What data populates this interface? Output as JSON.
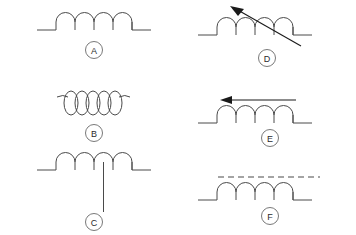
{
  "diagram": {
    "background_color": "#ffffff",
    "line_color": "#4a4a4a",
    "arrow_color": "#1a1a1a",
    "label_color": "#2b2b2b",
    "columns": 2,
    "rows": 3,
    "symbols": [
      {
        "label": "A",
        "name": "fixed-inductor",
        "description": "Fixed inductor: five semicircular humps with straight lead wires on both sides",
        "humps": 5,
        "has_arrow": false,
        "has_core_line": false,
        "has_center_tap": false,
        "coil_style": "arcs",
        "position": {
          "col": 1,
          "row": 1
        }
      },
      {
        "label": "B",
        "name": "air-core-coil",
        "description": "Coil drawn as five full elliptical loops with short angled lead wires",
        "humps": 5,
        "has_arrow": false,
        "has_core_line": false,
        "has_center_tap": false,
        "coil_style": "loops",
        "position": {
          "col": 1,
          "row": 2
        }
      },
      {
        "label": "C",
        "name": "center-tapped-inductor",
        "description": "Inductor with a vertical center tap lead dropping from the middle of the winding",
        "humps": 5,
        "has_arrow": false,
        "has_core_line": false,
        "has_center_tap": true,
        "coil_style": "arcs",
        "position": {
          "col": 1,
          "row": 3
        }
      },
      {
        "label": "D",
        "name": "variable-inductor-diagonal-arrow",
        "description": "Variable inductor: diagonal arrow crossing the winding pointing to the upper left",
        "humps": 5,
        "has_arrow": true,
        "arrow_type": "diagonal",
        "arrow_direction": "upper-left",
        "has_core_line": false,
        "has_center_tap": false,
        "coil_style": "arcs",
        "position": {
          "col": 2,
          "row": 1
        }
      },
      {
        "label": "E",
        "name": "adjustable-inductor-horizontal-arrow",
        "description": "Adjustable inductor: horizontal arrow above the winding pointing left",
        "humps": 5,
        "has_arrow": true,
        "arrow_type": "horizontal",
        "arrow_direction": "left",
        "has_core_line": false,
        "has_center_tap": false,
        "coil_style": "arcs",
        "position": {
          "col": 2,
          "row": 2
        }
      },
      {
        "label": "F",
        "name": "ferrite-core-inductor",
        "description": "Inductor with a dashed line above the winding indicating a ferrite or powdered-iron core",
        "humps": 5,
        "has_arrow": false,
        "has_core_line": true,
        "core_line_style": "dashed",
        "has_center_tap": false,
        "coil_style": "arcs",
        "position": {
          "col": 2,
          "row": 1
        }
      }
    ]
  }
}
